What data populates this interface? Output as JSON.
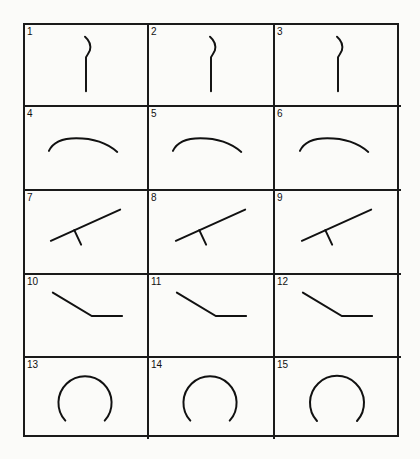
{
  "diagram": {
    "rows": 5,
    "columns": 3,
    "cells": [
      {
        "number": "1",
        "shape": "hook-vertical-line"
      },
      {
        "number": "2",
        "shape": "hook-vertical-line"
      },
      {
        "number": "3",
        "shape": "hook-vertical-line"
      },
      {
        "number": "4",
        "shape": "shallow-arc"
      },
      {
        "number": "5",
        "shape": "shallow-arc"
      },
      {
        "number": "6",
        "shape": "shallow-arc"
      },
      {
        "number": "7",
        "shape": "inclined-line-with-tick"
      },
      {
        "number": "8",
        "shape": "inclined-line-with-tick"
      },
      {
        "number": "9",
        "shape": "inclined-line-with-tick"
      },
      {
        "number": "10",
        "shape": "bent-line"
      },
      {
        "number": "11",
        "shape": "bent-line"
      },
      {
        "number": "12",
        "shape": "bent-line"
      },
      {
        "number": "13",
        "shape": "open-circle"
      },
      {
        "number": "14",
        "shape": "open-circle"
      },
      {
        "number": "15",
        "shape": "open-circle"
      }
    ]
  }
}
